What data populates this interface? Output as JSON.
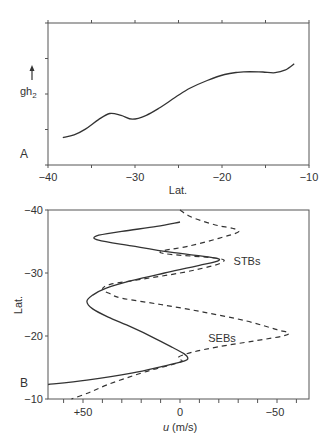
{
  "chart_data": [
    {
      "panel": "A",
      "type": "line",
      "title": "",
      "xlabel": "Lat.",
      "ylabel": "gh2",
      "ylabel_arrow": "up",
      "xlim": [
        -40,
        -10
      ],
      "ylim": [
        0,
        4
      ],
      "x_ticks": [
        -40,
        -35,
        -30,
        -25,
        -20,
        -15,
        -10
      ],
      "x_tick_labels": [
        "−40",
        "−30",
        "−20",
        "−10"
      ],
      "x_tick_label_values": [
        -40,
        -30,
        -20,
        -10
      ],
      "y_ticks": [
        0,
        1,
        2,
        3,
        4
      ],
      "grid": false,
      "series": [
        {
          "name": "gh2",
          "style": "solid",
          "x": [
            -38.3,
            -37.0,
            -35.7,
            -34.2,
            -32.9,
            -31.6,
            -30.3,
            -28.7,
            -27.1,
            -25.4,
            -23.7,
            -21.7,
            -19.7,
            -18.2,
            -16.8,
            -15.3,
            -13.9,
            -12.7,
            -11.7
          ],
          "y": [
            0.77,
            0.85,
            1.01,
            1.28,
            1.45,
            1.4,
            1.29,
            1.4,
            1.62,
            1.9,
            2.16,
            2.38,
            2.55,
            2.61,
            2.63,
            2.62,
            2.6,
            2.68,
            2.85
          ]
        }
      ]
    },
    {
      "panel": "B",
      "type": "line",
      "title": "",
      "xlabel": "u (m/s)",
      "ylabel": "Lat.",
      "xlim": [
        68,
        -67
      ],
      "ylim": [
        -10,
        -40
      ],
      "x_ticks": [
        60,
        50,
        40,
        30,
        20,
        10,
        0,
        -10,
        -20,
        -30,
        -40,
        -50,
        -60
      ],
      "x_tick_labels": [
        "+50",
        "0",
        "−50"
      ],
      "x_tick_label_values": [
        50,
        0,
        -50
      ],
      "y_ticks": [
        -40,
        -30,
        -20,
        -10
      ],
      "y_tick_labels": [
        "−40",
        "−30",
        "−20",
        "−10"
      ],
      "grid": false,
      "annotations": [
        {
          "text": "STBs",
          "u": -35,
          "lat": -32
        },
        {
          "text": "SEBs",
          "u": -22,
          "lat": -19.5
        }
      ],
      "series": [
        {
          "name": "solid",
          "style": "solid",
          "lat": [
            -38.1,
            -37.4,
            -36.6,
            -35.9,
            -35.2,
            -34.3,
            -33.3,
            -32.5,
            -32.0,
            -31.2,
            -30.0,
            -28.8,
            -27.6,
            -26.5,
            -25.5,
            -24.3,
            -23.0,
            -21.4,
            -19.8,
            -18.2,
            -17.2,
            -16.5,
            -16.0,
            -15.1,
            -14.1,
            -13.0,
            -12.3
          ],
          "u": [
            0,
            12,
            30,
            43,
            42,
            25,
            5,
            -16,
            -20,
            -10,
            8,
            25,
            38,
            45,
            48,
            45,
            37,
            25,
            14,
            4,
            -2,
            -4,
            -2,
            10,
            25,
            48,
            68
          ]
        },
        {
          "name": "dashed",
          "style": "dashed",
          "lat": [
            -40.0,
            -39.0,
            -38.2,
            -37.5,
            -37.1,
            -36.5,
            -35.5,
            -34.3,
            -33.2,
            -32.3,
            -31.6,
            -31.0,
            -30.0,
            -29.0,
            -28.2,
            -27.4,
            -26.7,
            -26.0,
            -25.0,
            -23.8,
            -22.4,
            -21.0,
            -20.5,
            -20.0,
            -19.2,
            -18.3,
            -17.4,
            -16.6,
            -16.0,
            -15.4,
            -14.4,
            -13.3,
            -12.2,
            -11.0,
            -10.0
          ],
          "u": [
            0,
            -5,
            -12,
            -20,
            -27,
            -30,
            -20,
            -5,
            10,
            -20,
            -21,
            -15,
            0,
            20,
            36,
            40,
            36,
            30,
            10,
            -12,
            -34,
            -50,
            -56,
            -53,
            -38,
            -20,
            -6,
            1,
            -1,
            5,
            17,
            28,
            38,
            47,
            56
          ]
        }
      ]
    }
  ],
  "panel_a": {
    "label": "A",
    "ylabel": "gh",
    "ylabel_sub": "2",
    "xlabel": "Lat.",
    "x_tick_labels": [
      "−40",
      "−30",
      "−20",
      "−10"
    ]
  },
  "panel_b": {
    "label": "B",
    "ylabel": "Lat.",
    "xlabel_var": "u",
    "xlabel_unit": " (m/s)",
    "x_tick_labels": [
      "+50",
      "0",
      "−50"
    ],
    "y_tick_labels": [
      "−40",
      "−30",
      "−20",
      "−10"
    ],
    "annot_stbs": "STBs",
    "annot_sebs": "SEBs"
  }
}
